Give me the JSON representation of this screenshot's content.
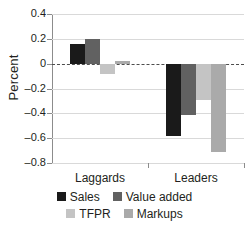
{
  "chart_data": {
    "type": "bar",
    "title": "",
    "subtitle": "",
    "xlabel": "",
    "ylabel": "Percent",
    "categories": [
      "Laggards",
      "Leaders"
    ],
    "series": [
      {
        "name": "Sales",
        "values": [
          0.16,
          -0.58
        ],
        "color": "#1a1a1a"
      },
      {
        "name": "Value added",
        "values": [
          0.2,
          -0.41
        ],
        "color": "#616161"
      },
      {
        "name": "TFPR",
        "values": [
          -0.08,
          -0.29
        ],
        "color": "#c4c4c4"
      },
      {
        "name": "Markups",
        "values": [
          0.02,
          -0.71
        ],
        "color": "#aaaaaa"
      }
    ],
    "ylim": [
      -0.8,
      0.4
    ],
    "yticks": [
      0.4,
      0.2,
      0,
      -0.2,
      -0.4,
      -0.6,
      -0.8
    ],
    "ytick_labels": [
      "0.4",
      "0.2",
      "0",
      "–0.2",
      "–0.4",
      "–0.6",
      "–0.8"
    ],
    "grid": true,
    "zero_line": true,
    "zero_line_style": "dashed",
    "legend_position": "bottom",
    "legend_rows": [
      [
        "Sales",
        "Value added"
      ],
      [
        "TFPR",
        "Markups"
      ]
    ]
  },
  "axis": {
    "y_title": "Percent"
  },
  "colors": {
    "grid": "#d9d9d9",
    "axis": "#8c8c8c",
    "text": "#231f20",
    "background": "#ffffff"
  }
}
